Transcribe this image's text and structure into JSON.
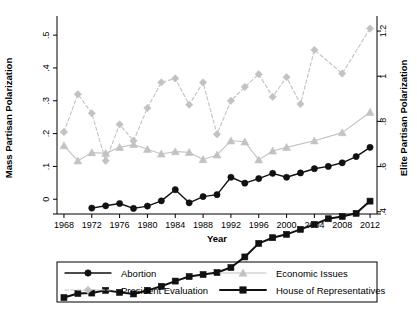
{
  "chart_data": {
    "type": "line",
    "title": "",
    "xlabel": "Year",
    "ylabel": "Mass Partisan Polarization",
    "y2label": "Elite Partisan Polarization",
    "xlim": [
      1967,
      2013
    ],
    "ylim": [
      -0.045,
      0.54
    ],
    "y2lim": [
      0.39,
      1.24
    ],
    "grid": false,
    "legend_position": "bottom",
    "xticks": [
      1968,
      1972,
      1976,
      1980,
      1984,
      1988,
      1992,
      1996,
      2000,
      2004,
      2008,
      2012
    ],
    "xtick_labels": [
      "1968",
      "1972",
      "1976",
      "1980",
      "1984",
      "1988",
      "1992",
      "1996",
      "2000",
      "2004",
      "2008",
      "2012"
    ],
    "yticks": [
      0,
      0.1,
      0.2,
      0.3,
      0.4,
      0.5
    ],
    "ytick_labels": [
      "0",
      ".1",
      ".2",
      ".3",
      ".4",
      ".5"
    ],
    "y2ticks": [
      0.4,
      0.6,
      0.8,
      1.0,
      1.2
    ],
    "y2tick_labels": [
      ".4",
      ".6",
      ".8",
      "1",
      "1.2"
    ],
    "series": [
      {
        "name": "Abortion",
        "axis": "left",
        "color": "#111111",
        "marker": "circle",
        "dash": "solid",
        "line_width": 1.4,
        "x": [
          1972,
          1974,
          1976,
          1978,
          1980,
          1982,
          1984,
          1986,
          1988,
          1990,
          1992,
          1994,
          1996,
          1998,
          2000,
          2002,
          2004,
          2006,
          2008,
          2010,
          2012
        ],
        "values": [
          -0.027,
          -0.02,
          -0.013,
          -0.028,
          -0.021,
          -0.005,
          0.029,
          -0.011,
          0.008,
          0.014,
          0.067,
          0.049,
          0.063,
          0.079,
          0.067,
          0.08,
          0.093,
          0.1,
          0.111,
          0.13,
          0.158
        ]
      },
      {
        "name": "President Evaluation",
        "axis": "left",
        "color": "#c2c2c2",
        "marker": "diamond",
        "dash": "dashed",
        "line_width": 1.1,
        "x": [
          1968,
          1970,
          1972,
          1974,
          1976,
          1978,
          1980,
          1982,
          1984,
          1986,
          1988,
          1990,
          1992,
          1994,
          1996,
          1998,
          2000,
          2002,
          2004,
          2008,
          2012
        ],
        "values": [
          0.205,
          0.32,
          0.262,
          0.117,
          0.228,
          0.178,
          0.278,
          0.356,
          0.368,
          0.288,
          0.356,
          0.198,
          0.3,
          0.342,
          0.381,
          0.312,
          0.372,
          0.29,
          0.455,
          0.383,
          0.52
        ]
      },
      {
        "name": "Economic Issues",
        "axis": "left",
        "color": "#c2c2c2",
        "marker": "triangle",
        "dash": "solid",
        "line_width": 1.1,
        "x": [
          1968,
          1970,
          1972,
          1974,
          1976,
          1978,
          1980,
          1982,
          1984,
          1986,
          1988,
          1990,
          1992,
          1994,
          1996,
          1998,
          2000,
          2004,
          2008,
          2012
        ],
        "values": [
          0.163,
          0.117,
          0.142,
          0.14,
          0.158,
          0.167,
          0.152,
          0.138,
          0.145,
          0.143,
          0.121,
          0.135,
          0.178,
          0.175,
          0.12,
          0.147,
          0.158,
          0.178,
          0.203,
          0.265
        ]
      },
      {
        "name": "House of Representatives",
        "axis": "right",
        "color": "#111111",
        "marker": "square",
        "dash": "solid",
        "line_width": 2.0,
        "x": [
          1968,
          1970,
          1972,
          1974,
          1976,
          1978,
          1980,
          1982,
          1984,
          1986,
          1988,
          1990,
          1992,
          1994,
          1996,
          1998,
          2000,
          2002,
          2004,
          2006,
          2008,
          2010,
          2012
        ],
        "values": [
          0.02,
          0.038,
          0.04,
          0.052,
          0.043,
          0.036,
          0.052,
          0.07,
          0.093,
          0.113,
          0.122,
          0.131,
          0.153,
          0.2,
          0.26,
          0.285,
          0.3,
          0.322,
          0.344,
          0.369,
          0.379,
          0.393,
          0.447
        ]
      }
    ]
  },
  "legend": {
    "items": [
      {
        "label": "Abortion",
        "key": "abortion"
      },
      {
        "label": "Economic Issues",
        "key": "economic-issues"
      },
      {
        "label": "President Evaluation",
        "key": "president-evaluation"
      },
      {
        "label": "House of Representatives",
        "key": "house-of-representatives"
      }
    ]
  },
  "colors": {
    "dark": "#111111",
    "light": "#c2c2c2",
    "frame": "#000000",
    "background": "#ffffff"
  }
}
